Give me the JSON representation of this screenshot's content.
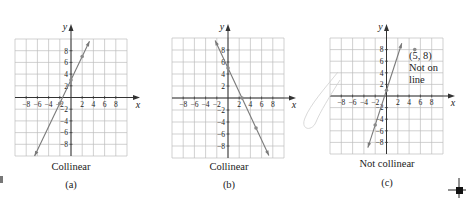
{
  "figure": {
    "panels": [
      {
        "id": "a",
        "caption": "Collinear",
        "sublabel": "(a)",
        "note": ""
      },
      {
        "id": "b",
        "caption": "Collinear",
        "sublabel": "(b)",
        "note": ""
      },
      {
        "id": "c",
        "caption": "Not collinear",
        "sublabel": "(c)",
        "note_lines": [
          "(5, 8)",
          "Not on",
          "line"
        ]
      }
    ],
    "axis_labels": {
      "x": "x",
      "y": "y"
    },
    "x_ticks": [
      -8,
      -6,
      -4,
      -2,
      2,
      4,
      6,
      8
    ],
    "y_ticks": [
      8,
      6,
      4,
      2,
      -2,
      -4,
      -6,
      -8
    ],
    "colors": {
      "grid": "#bdbdbd",
      "axis": "#333333",
      "line": "#7a7a7a",
      "point": "#8a8a8a",
      "text": "#222222"
    }
  },
  "chart_data": [
    {
      "type": "line",
      "title": "Collinear (a)",
      "xlabel": "x",
      "ylabel": "y",
      "xlim": [
        -10,
        10
      ],
      "ylim": [
        -10,
        10
      ],
      "grid": true,
      "x_tick_labels": [
        "-8",
        "-6",
        "-4",
        "-2",
        "2",
        "4",
        "6",
        "8"
      ],
      "y_tick_labels": [
        "8",
        "6",
        "4",
        "2",
        "-2",
        "-4",
        "-6",
        "-8"
      ],
      "line": {
        "slope": 2,
        "intercept": 3,
        "x_start": -6.5,
        "x_end": 3.3
      },
      "points": [
        [
          -2,
          -1
        ],
        [
          0,
          3
        ],
        [
          2,
          7
        ]
      ]
    },
    {
      "type": "line",
      "title": "Collinear (b)",
      "xlabel": "x",
      "ylabel": "y",
      "xlim": [
        -10,
        10
      ],
      "ylim": [
        -10,
        10
      ],
      "grid": true,
      "x_tick_labels": [
        "-8",
        "-6",
        "-4",
        "-2",
        "2",
        "4",
        "6",
        "8"
      ],
      "y_tick_labels": [
        "8",
        "6",
        "4",
        "2",
        "-2",
        "-4",
        "-6",
        "-8"
      ],
      "line": {
        "slope": -2,
        "intercept": 5,
        "x_start": -2.3,
        "x_end": 7.3
      },
      "points": [
        [
          0,
          5
        ],
        [
          2.5,
          0
        ],
        [
          5,
          -5
        ]
      ]
    },
    {
      "type": "line",
      "title": "Not collinear (c)",
      "xlabel": "x",
      "ylabel": "y",
      "xlim": [
        -10,
        10
      ],
      "ylim": [
        -10,
        10
      ],
      "grid": true,
      "x_tick_labels": [
        "-8",
        "-6",
        "-4",
        "-2",
        "2",
        "4",
        "6",
        "8"
      ],
      "y_tick_labels": [
        "8",
        "6",
        "4",
        "2",
        "-2",
        "-4",
        "-6",
        "-8"
      ],
      "line": {
        "slope": 3,
        "intercept": 1,
        "x_start": -3.3,
        "x_end": 2.7
      },
      "points": [
        [
          -2,
          -5
        ],
        [
          0,
          1
        ]
      ],
      "outlier": {
        "x": 5,
        "y": 8,
        "annotation": "(5, 8) Not on line"
      }
    }
  ]
}
